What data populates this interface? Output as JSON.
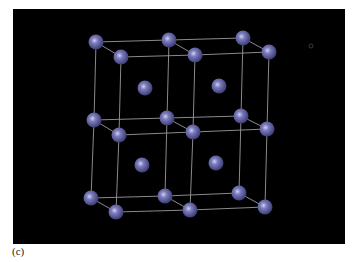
{
  "figure": {
    "caption_label": "(c)",
    "background_color": "#000000",
    "atom_color": "#6a6aa8",
    "atom_highlight": "#c8c8f0",
    "edge_color": "#9a9a9a",
    "atom_radius": 7.5,
    "corner_atoms": [
      [
        96,
        42
      ],
      [
        169,
        40
      ],
      [
        243,
        38
      ],
      [
        121,
        57
      ],
      [
        195,
        55
      ],
      [
        269,
        52
      ],
      [
        94,
        120
      ],
      [
        167,
        118
      ],
      [
        241,
        116
      ],
      [
        119,
        135
      ],
      [
        193,
        132
      ],
      [
        267,
        129
      ],
      [
        91,
        198
      ],
      [
        165,
        196
      ],
      [
        239,
        193
      ],
      [
        116,
        212
      ],
      [
        190,
        210
      ],
      [
        265,
        207
      ]
    ],
    "center_atoms": [
      [
        145,
        88
      ],
      [
        219,
        86
      ],
      [
        142,
        165
      ],
      [
        216,
        163
      ]
    ],
    "edges": [
      [
        0,
        1
      ],
      [
        1,
        2
      ],
      [
        3,
        4
      ],
      [
        4,
        5
      ],
      [
        0,
        3
      ],
      [
        1,
        4
      ],
      [
        2,
        5
      ],
      [
        6,
        7
      ],
      [
        7,
        8
      ],
      [
        9,
        10
      ],
      [
        10,
        11
      ],
      [
        6,
        9
      ],
      [
        7,
        10
      ],
      [
        8,
        11
      ],
      [
        12,
        13
      ],
      [
        13,
        14
      ],
      [
        15,
        16
      ],
      [
        16,
        17
      ],
      [
        12,
        15
      ],
      [
        13,
        16
      ],
      [
        14,
        17
      ],
      [
        0,
        6
      ],
      [
        1,
        7
      ],
      [
        2,
        8
      ],
      [
        3,
        9
      ],
      [
        4,
        10
      ],
      [
        5,
        11
      ],
      [
        6,
        12
      ],
      [
        7,
        13
      ],
      [
        8,
        14
      ],
      [
        9,
        15
      ],
      [
        10,
        16
      ],
      [
        11,
        17
      ]
    ],
    "marker": {
      "x": 311,
      "y": 46,
      "r": 2
    }
  }
}
